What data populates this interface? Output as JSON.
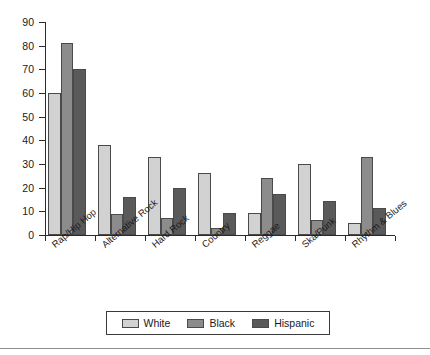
{
  "chart_data": {
    "type": "bar",
    "title": "",
    "subtitle": "",
    "xlabel": "",
    "ylabel": "",
    "ylim": [
      0,
      90
    ],
    "y_ticks": [
      0,
      10,
      20,
      30,
      40,
      50,
      60,
      70,
      80,
      90
    ],
    "grid": false,
    "legend_position": "bottom",
    "categories": [
      "Rap/Hip Hop",
      "Alternative Rock",
      "Hard Rock",
      "Country",
      "Reggae",
      "Ska/Punk",
      "Rhythm & Blues"
    ],
    "series": [
      {
        "name": "White",
        "color": "#d2d2d2",
        "values": [
          60,
          38,
          33,
          26,
          9.5,
          30,
          5
        ]
      },
      {
        "name": "Black",
        "color": "#8c8c8c",
        "values": [
          81,
          9,
          7,
          3,
          24,
          6.5,
          33
        ]
      },
      {
        "name": "Hispanic",
        "color": "#5a5a5a",
        "values": [
          70,
          16,
          20,
          9.5,
          17.5,
          14.5,
          11.5
        ]
      }
    ]
  },
  "legend": {
    "items": [
      {
        "label": "White"
      },
      {
        "label": "Black"
      },
      {
        "label": "Hispanic"
      }
    ]
  },
  "axes": {
    "y_tick_labels": [
      "0",
      "10",
      "20",
      "30",
      "40",
      "50",
      "60",
      "70",
      "80",
      "90"
    ]
  }
}
